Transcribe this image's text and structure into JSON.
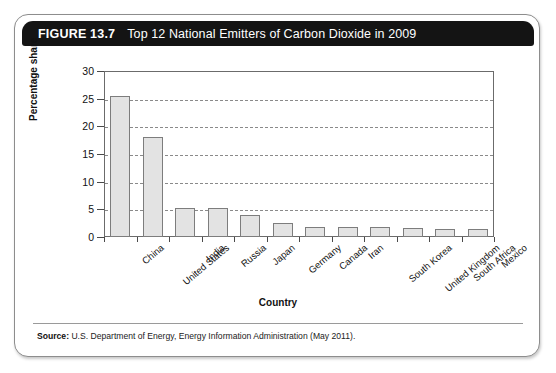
{
  "figure": {
    "number": "FIGURE 13.7",
    "title": "Top 12 National Emitters of Carbon Dioxide in 2009",
    "source_label": "Source:",
    "source_text": "U.S. Department of Energy, Energy Information Administration (May 2011)."
  },
  "chart_data": {
    "type": "bar",
    "title": "Top 12 National Emitters of Carbon Dioxide in 2009",
    "xlabel": "Country",
    "ylabel": "Percentage share",
    "ylim": [
      0,
      30
    ],
    "yticks": [
      0,
      5,
      10,
      15,
      20,
      25,
      30
    ],
    "grid": "horizontal-dashed",
    "legend": "none",
    "categories": [
      "China",
      "United States",
      "India",
      "Russia",
      "Japan",
      "Germany",
      "Canada",
      "Iran",
      "South Korea",
      "United Kingdom",
      "South Africa",
      "Mexico"
    ],
    "values": [
      25.4,
      18.0,
      5.3,
      5.2,
      3.9,
      2.5,
      1.9,
      1.8,
      1.8,
      1.6,
      1.5,
      1.5
    ],
    "bar_fill": "#e3e3e3",
    "bar_border": "#7d7d7d"
  },
  "colors": {
    "header_bg": "#141414",
    "header_text": "#ffffff",
    "card_border": "#8d8d8d",
    "grid": "#8a8a8a",
    "axis": "#6b6b6b"
  }
}
